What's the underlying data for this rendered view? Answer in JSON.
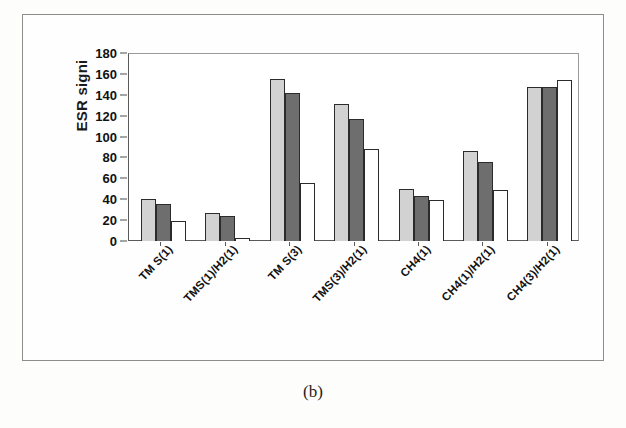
{
  "figure": {
    "caption": "(b)"
  },
  "chart_data": {
    "type": "bar",
    "title": "",
    "xlabel": "",
    "ylabel": "ESR signi",
    "ylim": [
      0,
      180
    ],
    "yticks": [
      0,
      20,
      40,
      60,
      80,
      100,
      120,
      140,
      160,
      180
    ],
    "grid": false,
    "legend": "none",
    "categories": [
      "TM S(1)",
      "TMS(1)/H2(1)",
      "TM S(3)",
      "TMS(3)/H2(1)",
      "CH4(1)",
      "CH4(1)/H2(1)",
      "CH4(3)/H2(1)"
    ],
    "series": [
      {
        "name": "series-1",
        "color": "#d2d2d2",
        "values": [
          40,
          27,
          155,
          131,
          50,
          86,
          147
        ]
      },
      {
        "name": "series-2",
        "color": "#6e6e6e",
        "values": [
          35,
          24,
          142,
          117,
          43,
          76,
          147
        ]
      },
      {
        "name": "series-3",
        "color": "#ffffff",
        "values": [
          19,
          3,
          56,
          88,
          39,
          49,
          154
        ]
      }
    ]
  }
}
